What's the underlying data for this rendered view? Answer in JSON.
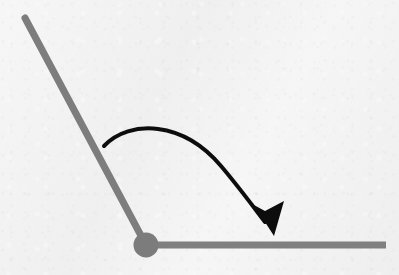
{
  "figure": {
    "title": "",
    "type": "physics-angle-diagram",
    "background_color": "#f1f1f1",
    "width": 399,
    "height": 275
  },
  "colors": {
    "rod": "#7d7d7d",
    "bar": "#808080",
    "pivot": "#7b7b7b",
    "arrow": "#111111",
    "background": "#f1f1f1"
  },
  "elements": {
    "pivot": {
      "name": "pivot-joint",
      "cx": 146,
      "cy": 245,
      "r": 12.5,
      "fill": "#7b7b7b"
    },
    "rod": {
      "name": "diagonal-rod",
      "x1": 25,
      "y1": 18,
      "x2": 146,
      "y2": 245,
      "stroke": "#7d7d7d",
      "stroke_width": 7
    },
    "bar": {
      "name": "horizontal-bar",
      "x1": 150,
      "y1": 245,
      "x2": 386,
      "y2": 245,
      "stroke": "#808080",
      "stroke_width": 7
    },
    "arrow": {
      "name": "rotation-arrow",
      "path": "M 104 146 C 130 119 183 121 221 166 C 238 186 252 205 265 222",
      "stroke": "#111111",
      "stroke_width": 4,
      "head": {
        "tip_x": 274,
        "tip_y": 236,
        "points": "274,236 254,205 265,211 284,201"
      }
    }
  },
  "chart_data": {
    "type": "diagram",
    "title": "",
    "annotations": [
      {
        "label": "rod-start-angle",
        "description": "rod inclined up-left from pivot",
        "angle_deg_from_horizontal": 118
      },
      {
        "label": "rod-end-angle",
        "description": "horizontal reference bar to the right of pivot",
        "angle_deg_from_horizontal": 0
      },
      {
        "label": "rotation-direction",
        "description": "clockwise sweep from rod toward horizontal bar"
      }
    ]
  }
}
